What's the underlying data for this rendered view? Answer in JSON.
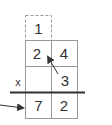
{
  "diagram": {
    "type": "column-multiplication",
    "carry": {
      "value": "1"
    },
    "multiplicand": [
      "2",
      "4"
    ],
    "multiplier": [
      "",
      "3"
    ],
    "operator": "x",
    "product": [
      "7",
      "2"
    ],
    "annotations": [
      {
        "kind": "arrow",
        "from": "multiplier-digit-3",
        "to": "multiplicand-digit-2"
      },
      {
        "kind": "arrow",
        "from": "left-margin",
        "to": "product-digit-7"
      }
    ],
    "colors": {
      "ink": "#333333",
      "grid": "#999999",
      "dashed": "#999999",
      "background": "#ffffff"
    }
  }
}
